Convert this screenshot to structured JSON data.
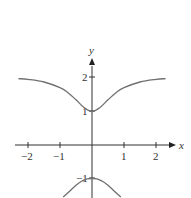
{
  "chart_data": {
    "type": "line",
    "title": "",
    "xlabel": "x",
    "ylabel": "y",
    "xlim": [
      -2.3,
      2.5
    ],
    "ylim": [
      -1.5,
      2.6
    ],
    "grid": false,
    "legend": null,
    "x_ticks": [
      -2,
      -1,
      1,
      2
    ],
    "x_tick_labels": [
      "−2",
      "−1",
      "1",
      "2"
    ],
    "y_ticks": [
      2,
      1,
      -1
    ],
    "y_tick_labels": [
      "2",
      "1",
      "−1"
    ],
    "series": [
      {
        "name": "upper branch",
        "x": [
          -2.3,
          -2,
          -1.5,
          -1,
          -0.75,
          -0.5,
          -0.25,
          0,
          0.25,
          0.5,
          0.75,
          1,
          1.5,
          2,
          2.3
        ],
        "y": [
          1.98,
          1.96,
          1.88,
          1.71,
          1.56,
          1.35,
          1.12,
          1.0,
          1.12,
          1.35,
          1.56,
          1.71,
          1.88,
          1.96,
          1.98
        ]
      },
      {
        "name": "lower branch",
        "x": [
          -0.9,
          -0.7,
          -0.5,
          -0.3,
          -0.15,
          0,
          0.15,
          0.3,
          0.5,
          0.7,
          0.9
        ],
        "y": [
          -1.55,
          -1.38,
          -1.2,
          -1.07,
          -1.01,
          -1.0,
          -1.01,
          -1.07,
          -1.2,
          -1.38,
          -1.55
        ]
      }
    ],
    "annotations": []
  },
  "labels": {
    "x_axis": "x",
    "y_axis": "y",
    "x_ticks": [
      "−2",
      "−1",
      "1",
      "2"
    ],
    "y_tick_2": "2",
    "y_tick_1": "1",
    "y_tick_neg1": "−1"
  },
  "colors": {
    "curve": "#707070",
    "axis": "#333333"
  }
}
